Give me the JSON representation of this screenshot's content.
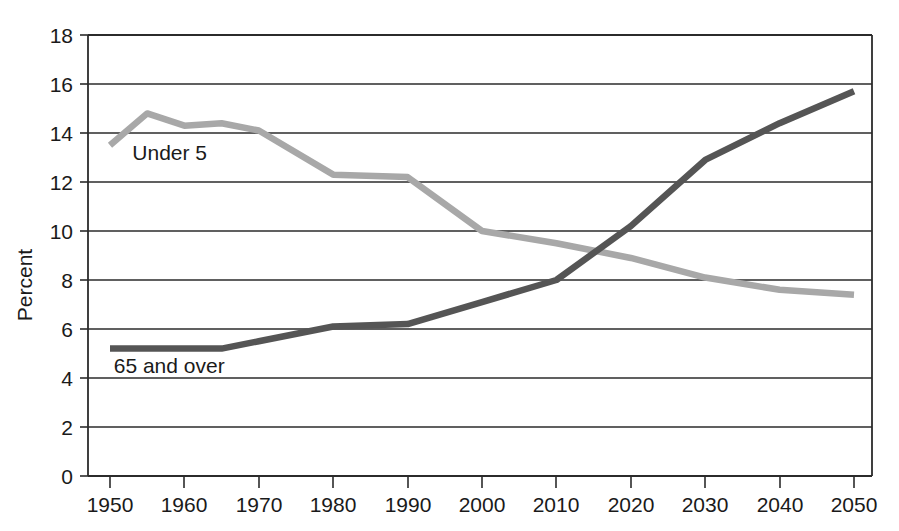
{
  "chart_data": {
    "type": "line",
    "title": "",
    "xlabel": "",
    "ylabel": "Percent",
    "xlim": [
      1950,
      2050
    ],
    "ylim": [
      0,
      18
    ],
    "grid": true,
    "grid_axis": "y",
    "legend": "inline-annotations",
    "x_ticks": [
      1950,
      1960,
      1970,
      1980,
      1990,
      2000,
      2010,
      2020,
      2030,
      2040,
      2050
    ],
    "y_ticks": [
      0,
      2,
      4,
      6,
      8,
      10,
      12,
      14,
      16,
      18
    ],
    "x": [
      1950,
      1955,
      1960,
      1965,
      1970,
      1980,
      1990,
      2000,
      2010,
      2020,
      2030,
      2040,
      2050
    ],
    "series": [
      {
        "name": "Under 5",
        "color": "#a8a8a8",
        "label_x": 1953,
        "label_y": 12.9,
        "values": [
          13.5,
          14.8,
          14.3,
          14.4,
          14.1,
          12.3,
          12.2,
          10.0,
          9.5,
          8.9,
          8.1,
          7.6,
          7.4
        ]
      },
      {
        "name": "65 and over",
        "color": "#555555",
        "label_x": 1950.5,
        "label_y": 4.2,
        "values": [
          5.2,
          5.2,
          5.2,
          5.2,
          5.5,
          6.1,
          6.2,
          7.1,
          8.0,
          10.2,
          12.9,
          14.4,
          15.7
        ]
      }
    ]
  },
  "labels": {
    "y_axis_title": "Percent",
    "series_under5": "Under 5",
    "series_65over": "65 and over",
    "y_0": "0",
    "y_2": "2",
    "y_4": "4",
    "y_6": "6",
    "y_8": "8",
    "y_10": "10",
    "y_12": "12",
    "y_14": "14",
    "y_16": "16",
    "y_18": "18",
    "x_1950": "1950",
    "x_1960": "1960",
    "x_1970": "1970",
    "x_1980": "1980",
    "x_1990": "1990",
    "x_2000": "2000",
    "x_2010": "2010",
    "x_2020": "2020",
    "x_2030": "2030",
    "x_2040": "2040",
    "x_2050": "2050"
  }
}
